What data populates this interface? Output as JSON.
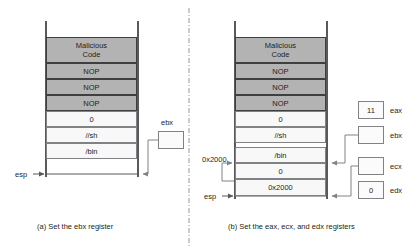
{
  "figure": {
    "title_a": "(a) Set the ebx register",
    "title_b": "(b) Set the eax, ecx, and edx registers"
  },
  "panel_a": {
    "caption": "(a) Set the ebx register",
    "stack_cells": [
      {
        "label": "Malicious\nCode",
        "line1": "Malicious",
        "line2": "Code",
        "shaded": true
      },
      {
        "label": "NOP",
        "shaded": true
      },
      {
        "label": "NOP",
        "shaded": true
      },
      {
        "label": "NOP",
        "shaded": true
      },
      {
        "label": "0",
        "shaded": false
      },
      {
        "label": "//sh",
        "shaded": false
      },
      {
        "label": "/bin",
        "shaded": false
      }
    ],
    "esp_label": "esp",
    "registers": [
      {
        "name": "ebx",
        "value": ""
      }
    ]
  },
  "panel_b": {
    "caption": "(b) Set the eax, ecx, and edx registers",
    "stack_cells": [
      {
        "label": "Malicious\nCode",
        "line1": "Malicious",
        "line2": "Code",
        "shaded": true
      },
      {
        "label": "NOP",
        "shaded": true
      },
      {
        "label": "NOP",
        "shaded": true
      },
      {
        "label": "NOP",
        "shaded": true
      },
      {
        "label": "0",
        "shaded": false
      },
      {
        "label": "//sh",
        "shaded": false
      },
      {
        "label": "/bin",
        "shaded": false
      },
      {
        "label": "0",
        "shaded": false
      },
      {
        "label": "0x2000",
        "shaded": false
      }
    ],
    "address_label": "0x2000",
    "esp_label": "esp",
    "registers": [
      {
        "name": "eax",
        "value": "11"
      },
      {
        "name": "ebx",
        "value": ""
      },
      {
        "name": "ecx",
        "value": ""
      },
      {
        "name": "edx",
        "value": "0"
      }
    ]
  },
  "colors": {
    "shaded_fill": "#b3b3b3",
    "plain_fill": "#f8f8f8",
    "stroke": "#58595b",
    "light_stroke": "#808285",
    "text": "#231f20"
  }
}
